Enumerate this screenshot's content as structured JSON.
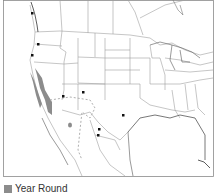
{
  "map": {
    "type": "range-map",
    "region": "Western and Central North America",
    "colors": {
      "year_round": "#8c8c8c",
      "border": "#8a8a8a",
      "boundary": "#9a9a9a",
      "point": "#111111",
      "dashed_range": "#b0b0b0"
    }
  },
  "legend": {
    "items": [
      {
        "label": "Year Round",
        "color": "#8c8c8c"
      }
    ]
  }
}
